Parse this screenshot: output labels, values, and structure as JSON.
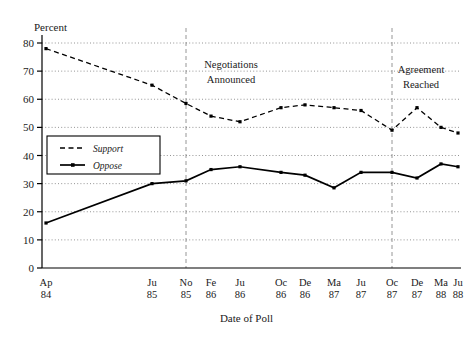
{
  "chart_data": {
    "type": "line",
    "title": "",
    "xlabel": "Date of Poll",
    "ylabel": "Percent",
    "ylim": [
      0,
      80
    ],
    "yticks": [
      0,
      10,
      20,
      30,
      40,
      50,
      60,
      70,
      80
    ],
    "grid": true,
    "legend_position": "left-inside",
    "x": [
      "Ap 84",
      "Ju 85",
      "No 85",
      "Fe 86",
      "Ju 86",
      "Oc 86",
      "De 86",
      "Ma 87",
      "Ju 87",
      "Oc 87",
      "De 87",
      "Ma 88",
      "Ju 88"
    ],
    "xtick_labels": [
      {
        "month": "Ap",
        "year": "84"
      },
      {
        "month": "Ju",
        "year": "85"
      },
      {
        "month": "No",
        "year": "85"
      },
      {
        "month": "Fe",
        "year": "86"
      },
      {
        "month": "Ju",
        "year": "86"
      },
      {
        "month": "Oc",
        "year": "86"
      },
      {
        "month": "De",
        "year": "86"
      },
      {
        "month": "Ma",
        "year": "87"
      },
      {
        "month": "Ju",
        "year": "87"
      },
      {
        "month": "Oc",
        "year": "87"
      },
      {
        "month": "De",
        "year": "87"
      },
      {
        "month": "Ma",
        "year": "88"
      },
      {
        "month": "Ju",
        "year": "88"
      }
    ],
    "series": [
      {
        "name": "Support",
        "style": "dashed",
        "values": [
          78,
          65,
          58.5,
          54,
          52,
          57,
          58,
          57,
          56,
          49,
          57,
          50,
          48
        ]
      },
      {
        "name": "Oppose",
        "style": "solid",
        "values": [
          16,
          30,
          31,
          35,
          36,
          34,
          33,
          28.5,
          34,
          34,
          32,
          37,
          36
        ]
      }
    ],
    "annotations": [
      {
        "name": "negotiations-announced",
        "line1": "Negotiations",
        "line2": "Announced",
        "at_x": "No 85"
      },
      {
        "name": "agreement-reached",
        "line1": "Agreement",
        "line2": "Reached",
        "at_x": "Oc 87"
      }
    ],
    "colors": {
      "line": "#000000",
      "grid": "#7a7a7a",
      "vline": "#8a8a8a",
      "axis": "#000000"
    }
  },
  "legend": {
    "items": [
      {
        "label": "Support",
        "style": "dashed"
      },
      {
        "label": "Oppose",
        "style": "solid"
      }
    ]
  }
}
